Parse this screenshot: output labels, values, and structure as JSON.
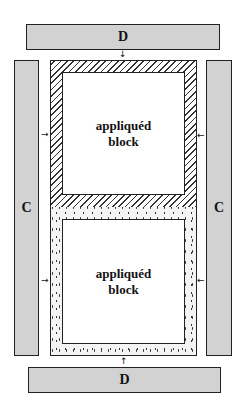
{
  "strips": {
    "top_d": "D",
    "bottom_d": "D",
    "left_c": "C",
    "right_c": "C"
  },
  "blocks": {
    "top": {
      "line1": "appliquéd",
      "line2": "block",
      "border_pattern": "diagonal-hatch"
    },
    "bottom": {
      "line1": "appliquéd",
      "line2": "block",
      "border_pattern": "stipple-dots"
    }
  },
  "arrows": {
    "down": "↓",
    "up": "↑",
    "right": "→",
    "left": "←"
  },
  "colors": {
    "strip_fill": "#d2d2d2",
    "outline": "#222222"
  }
}
